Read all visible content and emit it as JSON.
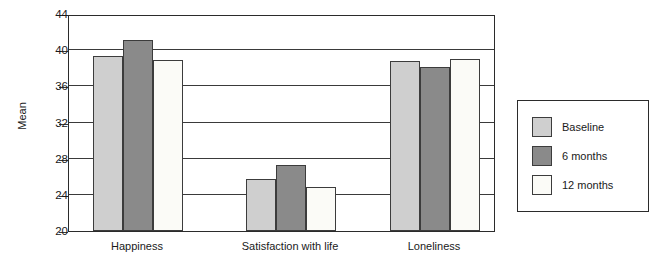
{
  "chart_data": {
    "type": "bar",
    "title": "",
    "xlabel": "",
    "ylabel": "Mean",
    "ylim": [
      20,
      44
    ],
    "yticks": [
      20,
      24,
      28,
      32,
      36,
      40,
      44
    ],
    "grid": true,
    "legend_position": "right",
    "categories": [
      "Happiness",
      "Satisfaction with life",
      "Loneliness"
    ],
    "series": [
      {
        "name": "Baseline",
        "color": "#cfcfcf",
        "values": [
          39.4,
          25.8,
          38.8
        ]
      },
      {
        "name": "6 months",
        "color": "#8a8a8a",
        "values": [
          41.1,
          27.3,
          38.1
        ]
      },
      {
        "name": "12 months",
        "color": "#fbfbf7",
        "values": [
          38.9,
          24.9,
          39.0
        ]
      }
    ]
  },
  "axis": {
    "y_title": "Mean",
    "y_tick_labels": [
      "20",
      "24",
      "28",
      "32",
      "36",
      "40",
      "44"
    ],
    "x_tick_labels": [
      "Happiness",
      "Satisfaction with life",
      "Loneliness"
    ]
  },
  "legend": {
    "items": [
      {
        "label": "Baseline",
        "color": "#cfcfcf"
      },
      {
        "label": "6 months",
        "color": "#8a8a8a"
      },
      {
        "label": "12 months",
        "color": "#fbfbf7"
      }
    ]
  }
}
